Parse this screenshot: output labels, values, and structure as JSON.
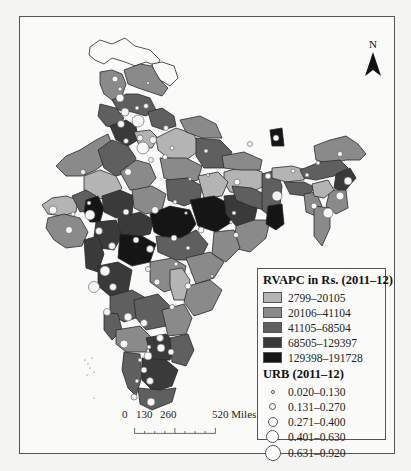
{
  "map": {
    "north_arrow": {
      "label": "N",
      "icon": "north-arrow-icon"
    },
    "scale_bar": {
      "labels": [
        "0",
        "130",
        "260",
        "520 Miles"
      ]
    },
    "colors": {
      "class1": "#b4b4b4",
      "class2": "#8a8a8a",
      "class3": "#5f5f5f",
      "class4": "#3a3a3a",
      "class5": "#151515",
      "unshaded": "#fafaf8",
      "circle_fill": "#f6f6f6",
      "border": "#2a2a2a"
    }
  },
  "legend": {
    "rvapc_title": "RVAPC in Rs. (2011–12)",
    "rvapc_classes": [
      {
        "label": "2799–20105",
        "color": "#b4b4b4"
      },
      {
        "label": "20106–41104",
        "color": "#8a8a8a"
      },
      {
        "label": "41105–68504",
        "color": "#5f5f5f"
      },
      {
        "label": "68505–129397",
        "color": "#3a3a3a"
      },
      {
        "label": "129398–191728",
        "color": "#151515"
      }
    ],
    "urb_title": "URB (2011–12)",
    "urb_classes": [
      {
        "label": "0.020–0.130",
        "size": 4
      },
      {
        "label": "0.131–0.270",
        "size": 7
      },
      {
        "label": "0.271–0.400",
        "size": 10
      },
      {
        "label": "0.401–0.630",
        "size": 13
      },
      {
        "label": "0.631–0.920",
        "size": 16
      }
    ]
  }
}
